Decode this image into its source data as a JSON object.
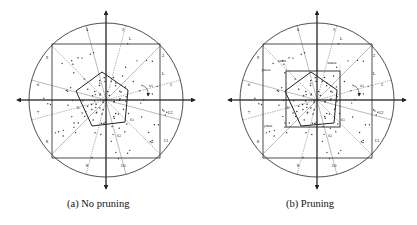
{
  "figure": {
    "panels": [
      {
        "id": "a",
        "caption": "(a) No pruning",
        "center": [
          106,
          100
        ],
        "radius": 77,
        "square": [
          52,
          44,
          160,
          158
        ],
        "pentagon": [
          [
            102,
            72
          ],
          [
            128,
            90
          ],
          [
            125,
            122
          ],
          [
            92,
            126
          ],
          [
            76,
            91
          ]
        ],
        "bbox": null,
        "region_labels": [
          {
            "text": "4",
            "x": 87,
            "y": 31
          },
          {
            "text": "3",
            "x": 123,
            "y": 31
          },
          {
            "text": "L",
            "x": 130,
            "y": 40
          },
          {
            "text": "5",
            "x": 47,
            "y": 59
          },
          {
            "text": "2",
            "x": 163,
            "y": 57
          },
          {
            "text": "L",
            "x": 163,
            "y": 75
          },
          {
            "text": "6",
            "x": 38,
            "y": 86
          },
          {
            "text": "1",
            "x": 171,
            "y": 86
          },
          {
            "text": "7",
            "x": 38,
            "y": 114
          },
          {
            "text": "12",
            "x": 170,
            "y": 114
          },
          {
            "text": "8",
            "x": 47,
            "y": 143
          },
          {
            "text": "11",
            "x": 166,
            "y": 142
          },
          {
            "text": "9",
            "x": 87,
            "y": 167
          },
          {
            "text": "10",
            "x": 123,
            "y": 167
          }
        ],
        "annotations": [
          {
            "text": "θ1",
            "x": 151,
            "y": 87
          },
          {
            "text": "S1",
            "x": 132,
            "y": 121
          },
          {
            "text": "S2",
            "x": 119,
            "y": 137
          },
          {
            "text": "R",
            "x": 78,
            "y": 109
          }
        ]
      },
      {
        "id": "b",
        "caption": "(b) Pruning",
        "center": [
          107,
          100
        ],
        "radius": 77,
        "square": [
          53,
          44,
          162,
          158
        ],
        "pentagon": [
          [
            101,
            72
          ],
          [
            127,
            90
          ],
          [
            124,
            123
          ],
          [
            91,
            126
          ],
          [
            75,
            91
          ]
        ],
        "bbox": [
          76,
          71,
          130,
          127
        ],
        "region_labels": [
          {
            "text": "4",
            "x": 88,
            "y": 31
          },
          {
            "text": "3",
            "x": 124,
            "y": 31
          },
          {
            "text": "L",
            "x": 131,
            "y": 40
          },
          {
            "text": "5",
            "x": 48,
            "y": 59
          },
          {
            "text": "2",
            "x": 164,
            "y": 57
          },
          {
            "text": "L",
            "x": 164,
            "y": 75
          },
          {
            "text": "6",
            "x": 39,
            "y": 86
          },
          {
            "text": "1",
            "x": 172,
            "y": 86
          },
          {
            "text": "7",
            "x": 39,
            "y": 114
          },
          {
            "text": "12",
            "x": 171,
            "y": 114
          },
          {
            "text": "8",
            "x": 48,
            "y": 143
          },
          {
            "text": "11",
            "x": 167,
            "y": 142
          },
          {
            "text": "9",
            "x": 88,
            "y": 167
          },
          {
            "text": "10",
            "x": 124,
            "y": 167
          }
        ],
        "annotations": [
          {
            "text": "θ1",
            "x": 152,
            "y": 87
          },
          {
            "text": "S1",
            "x": 133,
            "y": 121
          },
          {
            "text": "S2",
            "x": 120,
            "y": 137
          },
          {
            "text": "R",
            "x": 78,
            "y": 109
          },
          {
            "text": "xmin",
            "x": 72,
            "y": 62
          },
          {
            "text": "xmax",
            "x": 122,
            "y": 64
          },
          {
            "text": "ymax",
            "x": 56,
            "y": 71
          },
          {
            "text": "ymin",
            "x": 58,
            "y": 127
          }
        ]
      }
    ],
    "sector_count": 12,
    "colors": {
      "stroke": "#222222",
      "dash": "#555555",
      "point": "#333333",
      "background": "#ffffff"
    }
  }
}
